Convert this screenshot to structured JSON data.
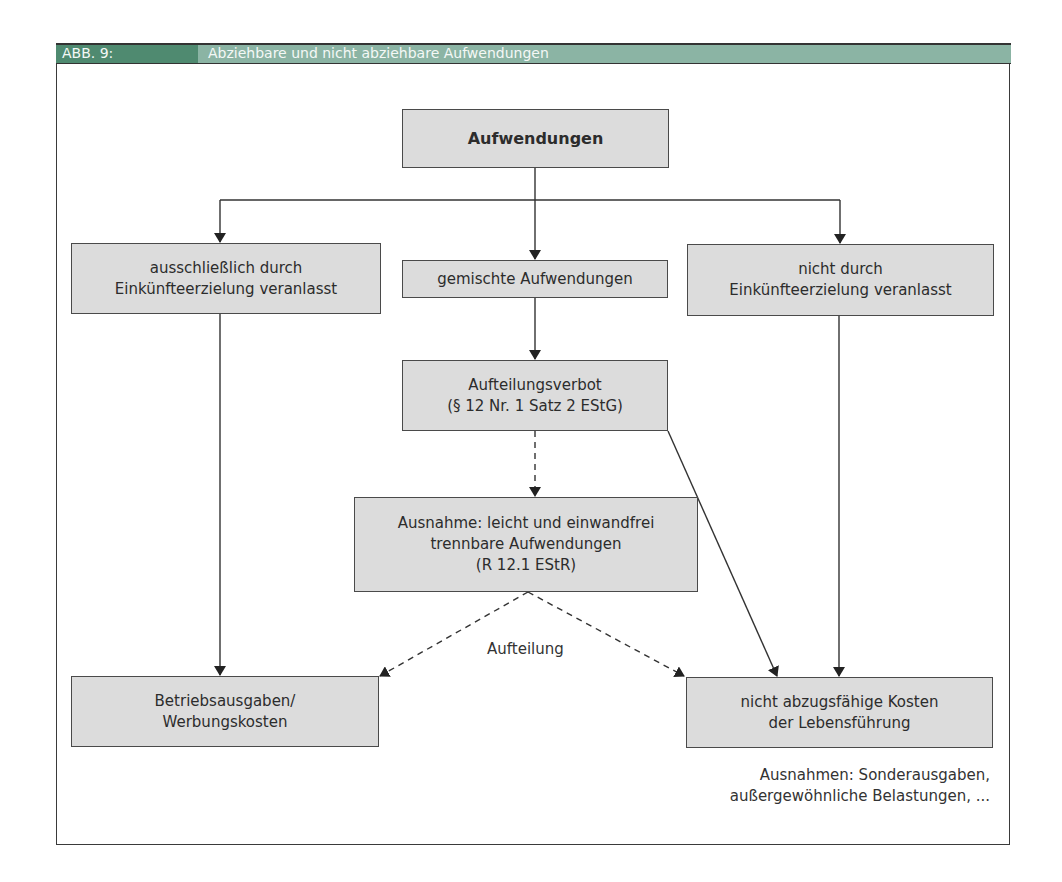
{
  "figure": {
    "number": "ABB. 9:",
    "title": "Abziehbare und nicht abziehbare Aufwendungen"
  },
  "nodes": {
    "root": "Aufwendungen",
    "exclusive": [
      "ausschließlich durch",
      "Einkünfteerzielung veranlasst"
    ],
    "mixed": "gemischte Aufwendungen",
    "not_caused": [
      "nicht durch",
      "Einkünfteerzielung veranlasst"
    ],
    "split_ban": [
      "Aufteilungsverbot",
      "(§ 12 Nr. 1 Satz 2 EStG)"
    ],
    "exception": [
      "Ausnahme: leicht und einwandfrei",
      "trennbare Aufwendungen",
      "(R 12.1 EStR)"
    ],
    "business_expenses": [
      "Betriebsausgaben/",
      "Werbungskosten"
    ],
    "living_costs": [
      "nicht abzugsfähige Kosten",
      "der Lebensführung"
    ]
  },
  "labels": {
    "split": "Aufteilung",
    "exceptions_note": [
      "Ausnahmen: Sonderausgaben,",
      "außergewöhnliche Belastungen, ..."
    ]
  },
  "colors": {
    "header_dark": "#4f8a70",
    "header_light": "#8bb4a4",
    "box_fill": "#dcdcdc"
  }
}
